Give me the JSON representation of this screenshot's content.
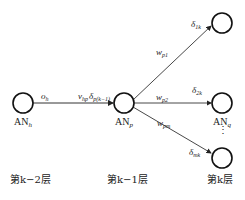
{
  "nodes": {
    "h": {
      "label": "AN",
      "sub": "h"
    },
    "p": {
      "label": "AN",
      "sub": "p"
    },
    "q": {
      "label": "AN",
      "sub": "q"
    }
  },
  "edges": {
    "hp": {
      "weight": "v",
      "weight_sub": "hp",
      "output": "o",
      "output_sub": "h",
      "delta": "δ",
      "delta_sub": "p(k−1)"
    },
    "p1": {
      "weight": "w",
      "weight_sub": "p1",
      "delta": "δ",
      "delta_sub": "1k"
    },
    "p2": {
      "weight": "w",
      "weight_sub": "p2",
      "delta": "δ",
      "delta_sub": "2k"
    },
    "pm": {
      "weight": "w",
      "weight_sub": "pm",
      "delta": "δ",
      "delta_sub": "mk"
    }
  },
  "ellipsis": "⋮",
  "layers": {
    "k2": "第k−2层",
    "k1": "第k−1层",
    "k": "第k层"
  }
}
